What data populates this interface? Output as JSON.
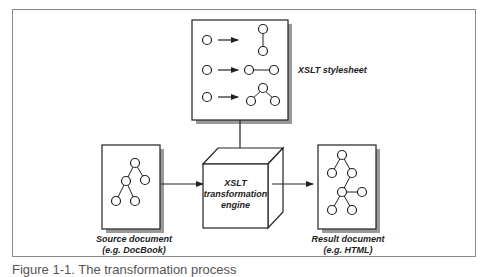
{
  "diagram": {
    "stylesheet": {
      "label": "XSLT stylesheet"
    },
    "source": {
      "label_line1": "Source document",
      "label_line2": "(e.g. DocBook)"
    },
    "engine": {
      "label_line1": "XSLT",
      "label_line2": "transformation",
      "label_line3": "engine"
    },
    "result": {
      "label_line1": "Result document",
      "label_line2": "(e.g. HTML)"
    }
  },
  "caption": "Figure 1-1. The transformation process",
  "colors": {
    "stroke": "#222222",
    "shadow": "#9a9a9a",
    "frame": "#8a8a8a"
  }
}
